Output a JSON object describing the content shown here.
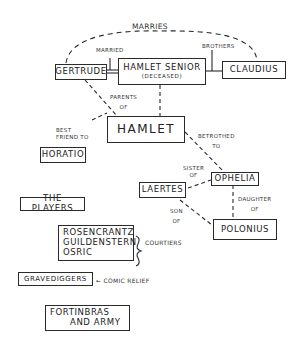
{
  "diagram": {
    "nodes": {
      "gertrude": "Gertrude",
      "hamlet_senior": "Hamlet Senior",
      "hamlet_senior_note": "(Deceased)",
      "claudius": "Claudius",
      "hamlet": "Hamlet",
      "horatio": "Horatio",
      "ophelia": "Ophelia",
      "laertes": "Laertes",
      "polonius": "Polonius",
      "the_players": "The Players",
      "courtiers_1": "Rosencrantz",
      "courtiers_2": "Guildenstern",
      "courtiers_3": "Osric",
      "gravediggers": "Gravediggers",
      "fortinbras_1": "Fortinbras",
      "fortinbras_2": "and Army"
    },
    "edges": {
      "marries": "Marries",
      "married": "Married",
      "brothers": "Brothers",
      "parents_of_1": "Parents",
      "parents_of_2": "of",
      "best_friend_1": "Best",
      "best_friend_2": "friend to",
      "betrothed_1": "Betrothed",
      "betrothed_2": "to",
      "sister_of_1": "Sister",
      "sister_of_2": "of",
      "son_of_1": "Son",
      "son_of_2": "of",
      "daughter_of_1": "Daughter",
      "daughter_of_2": "of"
    },
    "annotations": {
      "courtiers": "Courtiers",
      "comic_relief": "← Comic Relief"
    }
  }
}
